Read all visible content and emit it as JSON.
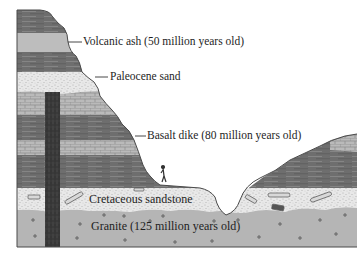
{
  "diagram": {
    "type": "geologic cross-section",
    "labels": {
      "volcanic_ash": "Volcanic ash (50 million years old)",
      "paleocene_sand": "Paleocene sand",
      "basalt_dike": "Basalt dike (80 million years old)",
      "cretaceous_sandstone": "Cretaceous sandstone",
      "granite": "Granite (125 million years old)"
    },
    "layers": [
      {
        "name": "shale-top",
        "pattern": "dark-striated"
      },
      {
        "name": "volcanic-ash",
        "pattern": "light-gray"
      },
      {
        "name": "shale-2",
        "pattern": "dark-striated"
      },
      {
        "name": "paleocene-sand",
        "pattern": "speckled"
      },
      {
        "name": "limestone-1",
        "pattern": "brick"
      },
      {
        "name": "shale-3",
        "pattern": "dark-striated"
      },
      {
        "name": "limestone-2",
        "pattern": "brick"
      },
      {
        "name": "shale-4",
        "pattern": "dark-striated"
      },
      {
        "name": "cretaceous-sandstone",
        "pattern": "speckled-with-fossils"
      },
      {
        "name": "granite",
        "pattern": "gray-with-crosses"
      }
    ],
    "colors": {
      "shale": "#6e6e6e",
      "ash": "#bdbdbd",
      "sand": "#e6e6e6",
      "limestone": "#b8b8b8",
      "granite": "#b5b5b5",
      "dike": "#3a3a3a",
      "outline": "#4a4a4a"
    }
  }
}
